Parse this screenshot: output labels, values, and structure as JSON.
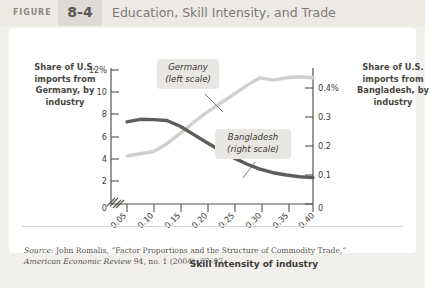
{
  "header": {
    "figure_word": "FIGURE",
    "figure_number": "8-4",
    "title": "Education, Skill Intensity, and Trade"
  },
  "axes": {
    "left_title": "Share of U.S. imports from Germany, by industry",
    "right_title": "Share of U.S. imports from Bangladesh, by industry",
    "x_title": "Skill intensity of industry"
  },
  "source": {
    "prefix": "Source:",
    "line1_rest": " John Romalis, “Factor Proportions and the Structure of Commodity Trade,”",
    "line2_italic": "American Economic Review",
    "line2_rest": " 94, no. 1 (2004): 67–97."
  },
  "colors": {
    "germany_line": "#d2d0cd",
    "bangladesh_line": "#5f5d5a",
    "axis": "#55524e",
    "card": "#ffffff",
    "page": "#f2f0ed",
    "header_band": "#edeae6",
    "header_chip": "#dedad5",
    "callout_bg": "#e8e6e3"
  },
  "chart_data": {
    "type": "line",
    "title": "Education, Skill Intensity, and Trade",
    "xlabel": "Skill intensity of industry",
    "xlim": [
      0.05,
      0.4
    ],
    "x_ticks": [
      "0",
      "0.05",
      "0.10",
      "0.15",
      "0.20",
      "0.25",
      "0.30",
      "0.35",
      "0.40"
    ],
    "x": [
      0.05,
      0.075,
      0.1,
      0.125,
      0.15,
      0.175,
      0.2,
      0.225,
      0.25,
      0.275,
      0.3,
      0.325,
      0.35,
      0.375,
      0.4
    ],
    "grid": false,
    "legend_position": "inline-callouts",
    "axis_break": true,
    "series": [
      {
        "name": "Germany",
        "callout": "Germany\n(left scale)",
        "scale": "left",
        "ylabel": "Share of U.S. imports from Germany, by industry",
        "ylim": [
          0,
          12
        ],
        "y_ticks": [
          "0",
          "2",
          "4",
          "6",
          "8",
          "10",
          "12%"
        ],
        "color": "#d2d0cd",
        "values": [
          4.3,
          4.5,
          4.7,
          5.4,
          6.3,
          7.3,
          8.2,
          9.0,
          9.8,
          10.6,
          11.3,
          11.1,
          11.3,
          11.4,
          11.3
        ]
      },
      {
        "name": "Bangladesh",
        "callout": "Bangladesh\n(right scale)",
        "scale": "right",
        "ylabel": "Share of U.S. imports from Bangladesh, by industry",
        "ylim": [
          0,
          0.4
        ],
        "y_ticks": [
          "0",
          "0.1",
          "0.2",
          "0.3",
          "0.4%"
        ],
        "color": "#5f5d5a",
        "values": [
          0.283,
          0.292,
          0.291,
          0.288,
          0.268,
          0.24,
          0.212,
          0.185,
          0.16,
          0.138,
          0.12,
          0.108,
          0.1,
          0.094,
          0.091
        ]
      }
    ]
  }
}
